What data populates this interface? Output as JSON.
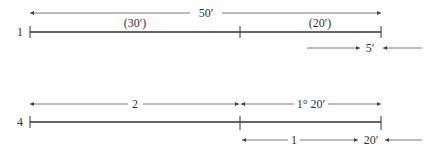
{
  "diagram": {
    "rows": [
      {
        "row_label": "1",
        "total_label": "50′",
        "segment_labels": [
          "(30′)",
          "(20′)"
        ],
        "offset_label": "5′"
      },
      {
        "row_label": "4",
        "total_label": "2",
        "segment_labels": [
          "1° 20′"
        ],
        "offset_labels": [
          "1",
          "20′"
        ]
      }
    ],
    "colors": {
      "line": "#333333",
      "dimension": "#555555",
      "background": "#ffffff"
    }
  }
}
